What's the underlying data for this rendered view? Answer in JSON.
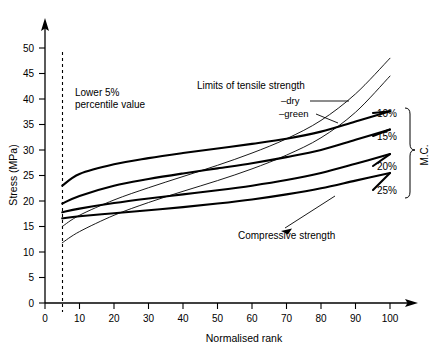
{
  "chart_data": {
    "type": "line",
    "title": "",
    "xlabel": "Normalised rank",
    "ylabel": "Stress (MPa)",
    "xlim": [
      0,
      105
    ],
    "ylim": [
      0,
      52
    ],
    "xticks": [
      0,
      10,
      20,
      30,
      40,
      50,
      60,
      70,
      80,
      90,
      100
    ],
    "yticks": [
      0,
      5,
      10,
      15,
      20,
      25,
      30,
      35,
      40,
      45,
      50
    ],
    "grid": false,
    "legend_position": "right",
    "annotations": [
      {
        "name": "lower-percentile",
        "text": "Lower 5%\npercentile value",
        "x": 12,
        "y": 41
      },
      {
        "name": "tensile-limits",
        "text": "Limits of tensile strength",
        "x": 47,
        "y": 44
      },
      {
        "name": "compressive-strength",
        "text": "Compressive strength",
        "x": 60,
        "y": 15
      }
    ],
    "reference_line": {
      "name": "lower-5-percentile",
      "x": 5,
      "style": "dashed"
    },
    "series": [
      {
        "name": "compressive-10pct",
        "label": "10%",
        "style": "thick",
        "x": [
          5,
          10,
          20,
          30,
          40,
          50,
          60,
          70,
          80,
          90,
          100
        ],
        "y": [
          23.0,
          25.3,
          27.2,
          28.4,
          29.4,
          30.3,
          31.2,
          32.2,
          33.6,
          35.6,
          37.6
        ]
      },
      {
        "name": "compressive-15pct",
        "label": "15%",
        "style": "thick",
        "x": [
          5,
          10,
          20,
          30,
          40,
          50,
          60,
          70,
          80,
          90,
          100
        ],
        "y": [
          19.5,
          21.0,
          23.0,
          24.3,
          25.4,
          26.4,
          27.4,
          28.6,
          30.0,
          32.0,
          34.0
        ]
      },
      {
        "name": "compressive-20pct",
        "label": "20%",
        "style": "thick",
        "x": [
          5,
          10,
          20,
          30,
          40,
          50,
          60,
          70,
          80,
          90,
          100
        ],
        "y": [
          17.8,
          18.5,
          19.6,
          20.5,
          21.3,
          22.1,
          23.0,
          24.1,
          25.5,
          27.3,
          29.2
        ]
      },
      {
        "name": "compressive-25pct",
        "label": "25%",
        "style": "thick",
        "x": [
          5,
          10,
          20,
          30,
          40,
          50,
          60,
          70,
          80,
          90,
          100
        ],
        "y": [
          16.6,
          17.0,
          17.6,
          18.2,
          18.8,
          19.5,
          20.3,
          21.3,
          22.5,
          24.0,
          25.5
        ]
      },
      {
        "name": "tensile-dry",
        "label": "dry",
        "style": "thin",
        "x": [
          5,
          10,
          20,
          30,
          40,
          50,
          60,
          70,
          80,
          90,
          100
        ],
        "y": [
          15.0,
          17.2,
          20.2,
          22.6,
          24.8,
          27.0,
          29.4,
          32.2,
          35.8,
          41.0,
          48.0
        ]
      },
      {
        "name": "tensile-green",
        "label": "green",
        "style": "thin",
        "x": [
          5,
          10,
          20,
          30,
          40,
          50,
          60,
          70,
          80,
          90,
          100
        ],
        "y": [
          11.8,
          14.0,
          17.2,
          19.7,
          21.9,
          24.0,
          26.3,
          29.0,
          32.4,
          37.4,
          44.5
        ]
      }
    ],
    "legend": {
      "group_label": "M.C.",
      "entries": [
        {
          "label": "10%",
          "y": 37.6
        },
        {
          "label": "15%",
          "y": 34.0
        },
        {
          "label": "20%",
          "y": 29.2
        },
        {
          "label": "25%",
          "y": 25.5
        }
      ]
    },
    "callouts": [
      {
        "label": "dry",
        "prefix": "–"
      },
      {
        "label": "green",
        "prefix": "–"
      }
    ]
  }
}
